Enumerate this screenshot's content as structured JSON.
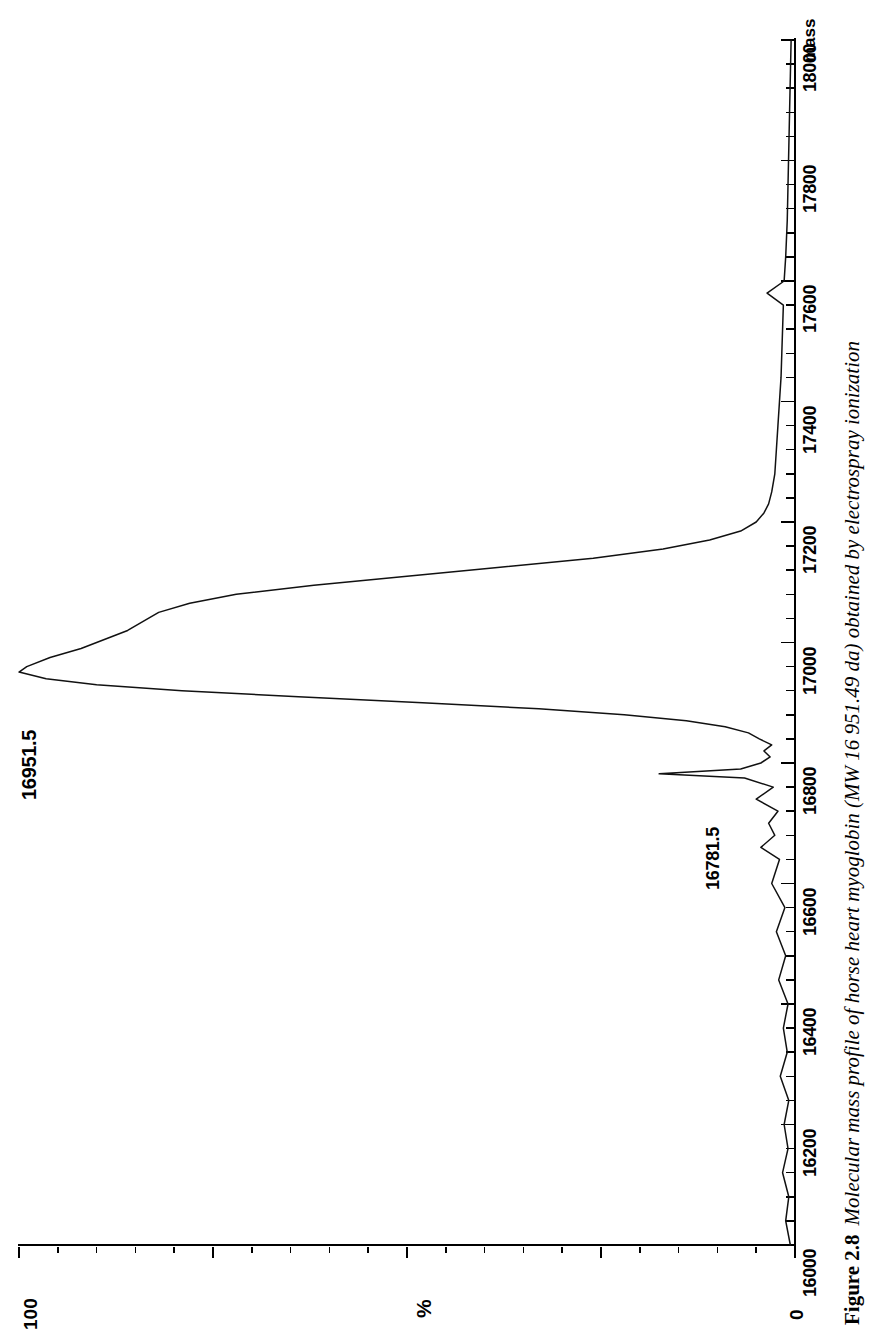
{
  "figure": {
    "number": "Figure 2.8",
    "caption": "Molecular mass profile of horse heart myoglobin (MW 16 951.49 da) obtained by electrospray ionization",
    "orientation": "rotated-90-ccw"
  },
  "chart_data": {
    "type": "line",
    "title": "",
    "xlabel": "mass",
    "ylabel": "%",
    "xlim": [
      16000,
      18000
    ],
    "ylim": [
      0,
      100
    ],
    "xticks_major": [
      16000,
      16200,
      16400,
      16600,
      16800,
      17000,
      17200,
      17400,
      17600,
      17800,
      18000
    ],
    "xtick_labels": [
      "16000",
      "16200",
      "16400",
      "16600",
      "16800",
      "17000",
      "17200",
      "17400",
      "17600",
      "17800",
      "18000"
    ],
    "xtick_minor_step": 40,
    "ytick_labels": [
      "100",
      "0"
    ],
    "grid": false,
    "legend": null,
    "annotations": [
      {
        "text": "16951.5",
        "x": 16951.5,
        "y": 100,
        "role": "base-peak-label"
      },
      {
        "text": "16781.5",
        "x": 16781.5,
        "y": 18,
        "role": "satellite-peak-label"
      }
    ],
    "x": [
      16000,
      16040,
      16080,
      16120,
      16160,
      16200,
      16240,
      16280,
      16320,
      16360,
      16400,
      16440,
      16480,
      16520,
      16560,
      16600,
      16640,
      16660,
      16680,
      16700,
      16720,
      16740,
      16760,
      16775,
      16782,
      16790,
      16800,
      16810,
      16820,
      16830,
      16840,
      16850,
      16860,
      16870,
      16880,
      16890,
      16900,
      16910,
      16920,
      16930,
      16940,
      16951,
      16960,
      16975,
      16990,
      17000,
      17010,
      17020,
      17035,
      17050,
      17065,
      17080,
      17095,
      17110,
      17125,
      17140,
      17155,
      17170,
      17185,
      17200,
      17215,
      17230,
      17250,
      17280,
      17320,
      17360,
      17400,
      17440,
      17480,
      17520,
      17560,
      17580,
      17600,
      17640,
      17700,
      17760,
      17820,
      17880,
      17940,
      18000
    ],
    "y": [
      0.6,
      1.2,
      0.8,
      1.6,
      0.9,
      1.4,
      0.8,
      1.9,
      1.0,
      1.5,
      0.9,
      2.1,
      1.2,
      2.4,
      1.3,
      3.0,
      2.0,
      4.4,
      2.6,
      3.4,
      2.2,
      5.0,
      2.8,
      6.5,
      17.5,
      7.0,
      4.4,
      3.2,
      4.0,
      3.0,
      4.6,
      6.0,
      9.0,
      14.0,
      22.0,
      33.0,
      48.0,
      64.0,
      79.0,
      90.0,
      96.5,
      100.0,
      99.0,
      96.0,
      92.0,
      90.0,
      88.0,
      86.0,
      84.0,
      82.0,
      78.0,
      72.0,
      62.0,
      50.0,
      38.0,
      26.0,
      17.0,
      11.0,
      7.0,
      5.0,
      4.0,
      3.4,
      3.0,
      2.6,
      2.4,
      2.2,
      2.0,
      1.8,
      1.7,
      1.6,
      1.5,
      3.6,
      1.4,
      1.2,
      1.0,
      0.9,
      0.8,
      0.7,
      0.6,
      0.5
    ],
    "baseline_note": "intensity drawn leftward from the vertical mass axis"
  },
  "axis": {
    "mass_caption": "mass",
    "pct_top": "100",
    "pct_symbol": "%",
    "pct_zero": "0"
  }
}
